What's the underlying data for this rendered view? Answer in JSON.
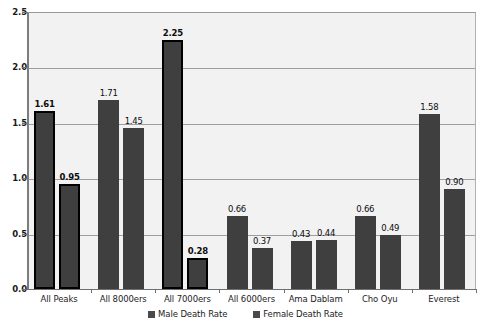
{
  "chart_data": {
    "type": "bar",
    "title": "",
    "xlabel": "",
    "ylabel": "",
    "ylim": [
      0,
      2.5
    ],
    "yticks": [
      "0.0",
      "0.5",
      "1.0",
      "1.5",
      "2.0",
      "2.5"
    ],
    "ytick_values": [
      0,
      0.5,
      1.0,
      1.5,
      2.0,
      2.5
    ],
    "grid": true,
    "legend_position": "bottom-center",
    "categories": [
      "All Peaks",
      "All 8000ers",
      "All 7000ers",
      "All 6000ers",
      "Ama Dablam",
      "Cho Oyu",
      "Everest"
    ],
    "highlighted_categories": [
      "All Peaks",
      "All 7000ers"
    ],
    "series": [
      {
        "name": "Male Death Rate",
        "color": "#3f3f3f",
        "values": [
          1.61,
          1.71,
          2.25,
          0.66,
          0.43,
          0.66,
          1.58
        ],
        "labels": [
          "1.61",
          "1.71",
          "2.25",
          "0.66",
          "0.43",
          "0.66",
          "1.58"
        ]
      },
      {
        "name": "Female Death Rate",
        "color": "#3f3f3f",
        "values": [
          0.95,
          1.45,
          0.28,
          0.37,
          0.44,
          0.49,
          0.9
        ],
        "labels": [
          "0.95",
          "1.45",
          "0.28",
          "0.37",
          "0.44",
          "0.49",
          "0.90"
        ]
      }
    ]
  },
  "legend": {
    "items": [
      {
        "label": "Male Death Rate",
        "swatch": "legend-swatch-male"
      },
      {
        "label": "Female Death Rate",
        "swatch": "legend-swatch-female"
      }
    ]
  },
  "title_sliver": "",
  "colors": {
    "bar_fill": "#3f3f3f",
    "bar_outline": "#000000",
    "plot_background": "#f2f2f2",
    "gridline": "#9d9d9d",
    "axis": "#6f6f6f",
    "text": "#1d1d1d"
  }
}
